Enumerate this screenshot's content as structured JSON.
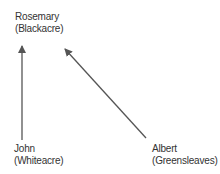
{
  "nodes": {
    "rosemary": {
      "name": "Rosemary",
      "place": "(Blackacre)"
    },
    "john": {
      "name": "John",
      "place": "(Whiteacre)"
    },
    "albert": {
      "name": "Albert",
      "place": "(Greensleaves)"
    }
  },
  "edges": [
    {
      "from": "john",
      "to": "rosemary"
    },
    {
      "from": "albert",
      "to": "rosemary"
    }
  ],
  "colors": {
    "arrow": "#555555",
    "text": "#333333"
  }
}
